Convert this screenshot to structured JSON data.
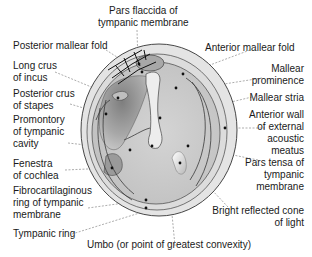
{
  "diagram": {
    "labels": {
      "pars_flaccida": [
        "Pars flaccida of",
        "tympanic membrane"
      ],
      "posterior_mallear_fold": [
        "Posterior mallear fold"
      ],
      "anterior_mallear_fold": [
        "Anterior mallear fold"
      ],
      "long_crus_incus": [
        "Long crus",
        "of incus"
      ],
      "mallear_prominence": [
        "Mallear",
        "prominence"
      ],
      "posterior_crus_stapes": [
        "Posterior crus",
        "of stapes"
      ],
      "mallear_stria": [
        "Mallear stria"
      ],
      "promontory": [
        "Promontory",
        "of tympanic",
        "cavity"
      ],
      "anterior_wall": [
        "Anterior wall",
        "of external",
        "acoustic",
        "meatus"
      ],
      "fenestra_cochlea": [
        "Fenestra",
        "of cochlea"
      ],
      "pars_tensa": [
        "Pars tensa of",
        "tympanic",
        "membrane"
      ],
      "fibrocartilaginous_ring": [
        "Fibrocartilaginous",
        "ring of tympanic",
        "membrane"
      ],
      "cone_of_light": [
        "Bright reflected cone",
        "of light"
      ],
      "tympanic_ring": [
        "Tympanic ring"
      ],
      "umbo": [
        "Umbo (or point of greatest convexity)"
      ]
    },
    "colors": {
      "outer_ring": "#e6e6e6",
      "membrane": "#d2d2d2",
      "cavity_dark": "#9a9a9a",
      "outline": "#3a3a3a",
      "leader_line": "#888888",
      "text": "#1a1a1a"
    }
  }
}
